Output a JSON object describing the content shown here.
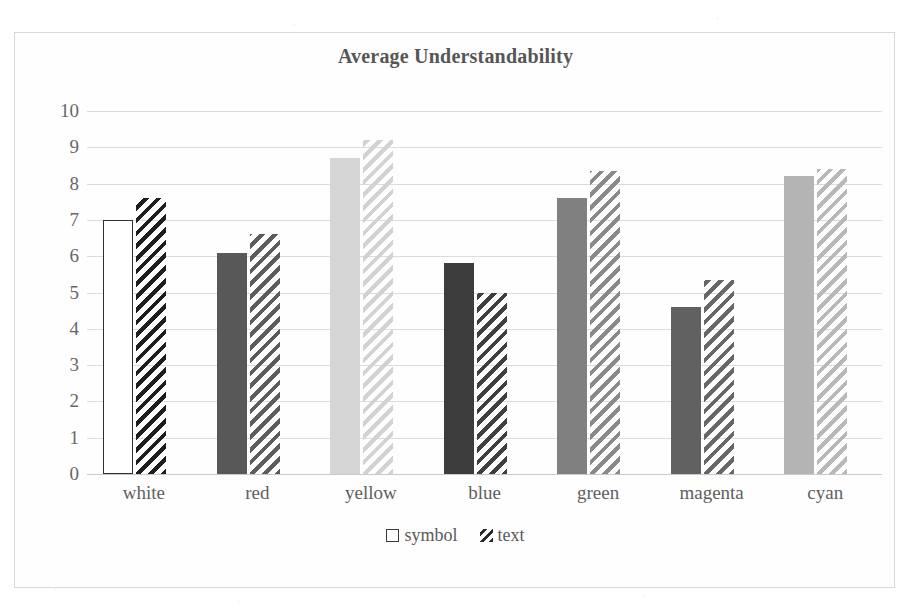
{
  "chart_data": {
    "type": "bar",
    "title": "Average Understandability",
    "xlabel": "",
    "ylabel": "",
    "ylim": [
      0,
      10
    ],
    "ytick_labels": [
      "10",
      "9",
      "8",
      "7",
      "6",
      "5",
      "4",
      "3",
      "2",
      "1",
      "0"
    ],
    "grid": true,
    "legend_position": "bottom",
    "categories": [
      "white",
      "red",
      "yellow",
      "blue",
      "green",
      "magenta",
      "cyan"
    ],
    "series": [
      {
        "name": "symbol",
        "values": [
          7.0,
          6.1,
          8.7,
          5.8,
          7.6,
          4.6,
          8.2
        ],
        "fills": [
          "#ffffff",
          "#585858",
          "#d6d6d6",
          "#3c3c3c",
          "#808080",
          "#616161",
          "#b4b4b4"
        ],
        "strokes": [
          "#2f2f2f",
          "none",
          "none",
          "none",
          "none",
          "none",
          "none"
        ]
      },
      {
        "name": "text",
        "values": [
          7.6,
          6.6,
          9.2,
          5.0,
          8.35,
          5.35,
          8.4
        ],
        "hatch_colors": [
          "#1e1e1e",
          "#5c5c5c",
          "#d2d2d2",
          "#3f3f3f",
          "#8a8a8a",
          "#676767",
          "#b8b8b8"
        ]
      }
    ],
    "legend": [
      {
        "label": "symbol",
        "swatch": "outlined-square"
      },
      {
        "label": "text",
        "swatch": "diagonal-hatch"
      }
    ]
  }
}
